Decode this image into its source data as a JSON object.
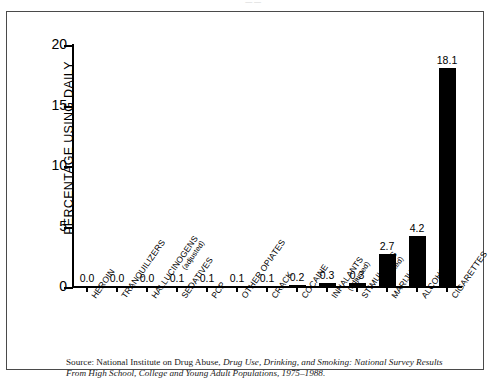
{
  "top_sliver_text": "— —",
  "chart_data": {
    "type": "bar",
    "title": "",
    "xlabel": "",
    "ylabel": "PERCENTAGE USING DAILY",
    "ylim": [
      0,
      20
    ],
    "yticks": [
      0,
      5,
      10,
      15,
      20
    ],
    "ytick_labels": [
      "0",
      "5",
      "10",
      "15",
      "20"
    ],
    "grid": false,
    "legend": "none",
    "bar_color": "#000000",
    "categories": [
      "HEROIN",
      "TRANQUILIZERS",
      "HALLUCINOGENS",
      "SEDATIVES",
      "PCP",
      "OTHER OPIATES",
      "CRACK",
      "COCAINE",
      "INHALANTS",
      "STIMULANTS",
      "MARIJUANA",
      "ALCOHOL",
      "CIGARETTES"
    ],
    "category_sublabels": [
      "",
      "",
      "(adjusted)",
      "",
      "",
      "",
      "",
      "",
      "(adjusted)",
      "(adjusted)",
      "",
      "",
      ""
    ],
    "values": [
      0.0,
      0.0,
      0.0,
      0.1,
      0.1,
      0.1,
      0.1,
      0.2,
      0.3,
      0.3,
      2.7,
      4.2,
      18.1
    ],
    "value_labels": [
      "0.0",
      "0.0",
      "0.0",
      "0.1",
      "0.1",
      "0.1",
      "0.1",
      "0.2",
      "0.3",
      "0.3",
      "2.7",
      "4.2",
      "18.1"
    ]
  },
  "source": {
    "line1_prefix": "Source: National Institute on Drug Abuse, ",
    "line1_italic": "Drug Use, Drinking, and Smoking: National Survey Results",
    "line2_italic": "From High School, College and Young Adult Populations, 1975–1988."
  }
}
